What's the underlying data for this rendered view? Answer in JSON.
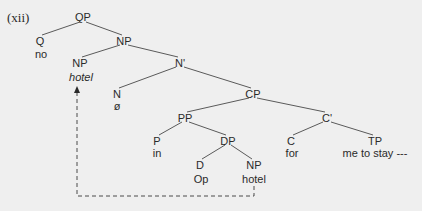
{
  "example_label": "(xii)",
  "nodes": {
    "qp": {
      "label": "QP"
    },
    "q": {
      "label": "Q",
      "word": "no"
    },
    "np_top": {
      "label": "NP"
    },
    "np_hotel": {
      "label": "NP",
      "word": "hotel"
    },
    "nbar": {
      "label": "N'"
    },
    "n": {
      "label": "N",
      "word": "ø"
    },
    "cp": {
      "label": "CP"
    },
    "pp": {
      "label": "PP"
    },
    "p": {
      "label": "P",
      "word": "in"
    },
    "dp": {
      "label": "DP"
    },
    "d": {
      "label": "D",
      "word": "Op"
    },
    "np_low": {
      "label": "NP",
      "word": "hotel"
    },
    "cbar": {
      "label": "C'"
    },
    "c": {
      "label": "C",
      "word": "for"
    },
    "tp": {
      "label": "TP",
      "word": "me to stay ---"
    }
  },
  "movement_arrow": {
    "from": "np_low",
    "to": "np_hotel",
    "style": "dashed"
  },
  "colors": {
    "background": "#efefef",
    "ink": "#2a2a2a",
    "branch": "#555555"
  }
}
